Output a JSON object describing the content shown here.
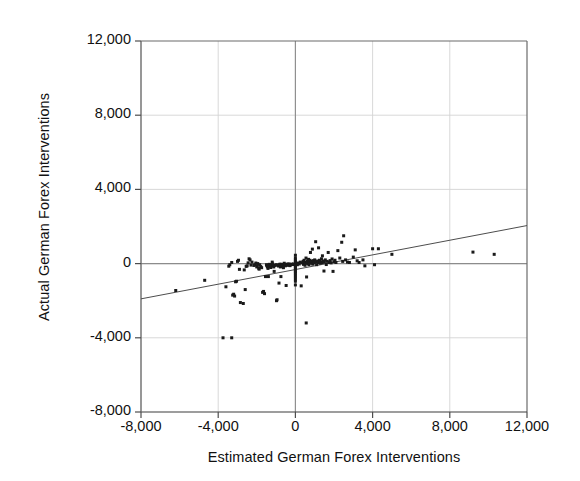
{
  "chart_data": {
    "type": "scatter",
    "title": "",
    "xlabel": "Estimated German Forex Interventions",
    "ylabel": "Actual German Forex Interventions",
    "xlim": [
      -8000,
      12000
    ],
    "ylim": [
      -8000,
      12000
    ],
    "xticks": [
      -8000,
      -4000,
      0,
      4000,
      8000,
      12000
    ],
    "yticks": [
      -8000,
      -4000,
      0,
      4000,
      8000,
      12000
    ],
    "xtick_labels": [
      "-8,000",
      "-4,000",
      "0",
      "4,000",
      "8,000",
      "12,000"
    ],
    "ytick_labels": [
      "-8,000",
      "-4,000",
      "0",
      "4,000",
      "8,000",
      "12,000"
    ],
    "grid": true,
    "legend": "none",
    "marker": "square",
    "marker_color": "#1a1a1a",
    "marker_size": 3,
    "fit_line": {
      "type": "linear",
      "slope": 0.1975,
      "intercept": -320,
      "x_start": -8000,
      "x_end": 12000,
      "y_start": -1900,
      "y_end": 2050,
      "color": "#4d4d4d"
    },
    "points": [
      [
        -6200,
        -1450
      ],
      [
        -4700,
        -900
      ],
      [
        -3750,
        -4000
      ],
      [
        -3300,
        -4000
      ],
      [
        -3600,
        -1250
      ],
      [
        -3450,
        -140
      ],
      [
        -3400,
        -60
      ],
      [
        -3300,
        60
      ],
      [
        -3250,
        -1700
      ],
      [
        -3200,
        -1650
      ],
      [
        -3150,
        -1750
      ],
      [
        -3100,
        -980
      ],
      [
        -3050,
        -950
      ],
      [
        -3000,
        120
      ],
      [
        -2950,
        180
      ],
      [
        -2900,
        -310
      ],
      [
        -2850,
        -2100
      ],
      [
        -2700,
        -2150
      ],
      [
        -2650,
        -340
      ],
      [
        -2600,
        -1400
      ],
      [
        -2550,
        -150
      ],
      [
        -2500,
        -120
      ],
      [
        -2450,
        40
      ],
      [
        -2400,
        260
      ],
      [
        -2350,
        200
      ],
      [
        -2300,
        -80
      ],
      [
        -2250,
        80
      ],
      [
        -2150,
        -100
      ],
      [
        -2100,
        -60
      ],
      [
        -2050,
        30
      ],
      [
        -2000,
        -180
      ],
      [
        -1980,
        -130
      ],
      [
        -1950,
        0
      ],
      [
        -1900,
        -250
      ],
      [
        -1880,
        -300
      ],
      [
        -1850,
        -60
      ],
      [
        -1800,
        -160
      ],
      [
        -1750,
        -220
      ],
      [
        -1700,
        -1550
      ],
      [
        -1650,
        -1500
      ],
      [
        -1600,
        -1620
      ],
      [
        -1550,
        -700
      ],
      [
        -1500,
        -60
      ],
      [
        -1480,
        -110
      ],
      [
        -1450,
        -180
      ],
      [
        -1420,
        -260
      ],
      [
        -1400,
        -700
      ],
      [
        -1380,
        -90
      ],
      [
        -1350,
        -40
      ],
      [
        -1300,
        -150
      ],
      [
        -1280,
        -210
      ],
      [
        -1250,
        -60
      ],
      [
        -1200,
        80
      ],
      [
        -1180,
        -20
      ],
      [
        -1150,
        -130
      ],
      [
        -1120,
        -180
      ],
      [
        -1100,
        -420
      ],
      [
        -1050,
        -100
      ],
      [
        -1000,
        -60
      ],
      [
        -980,
        -2000
      ],
      [
        -950,
        -1950
      ],
      [
        -900,
        -80
      ],
      [
        -880,
        -130
      ],
      [
        -850,
        -1050
      ],
      [
        -820,
        -60
      ],
      [
        -800,
        -30
      ],
      [
        -780,
        -180
      ],
      [
        -750,
        -700
      ],
      [
        -720,
        -90
      ],
      [
        -700,
        -40
      ],
      [
        -680,
        -150
      ],
      [
        -650,
        -60
      ],
      [
        -620,
        -220
      ],
      [
        -600,
        -80
      ],
      [
        -580,
        20
      ],
      [
        -550,
        -40
      ],
      [
        -520,
        -120
      ],
      [
        -500,
        -70
      ],
      [
        -480,
        -1180
      ],
      [
        -450,
        -60
      ],
      [
        -420,
        -30
      ],
      [
        -400,
        -90
      ],
      [
        -380,
        -50
      ],
      [
        -350,
        -20
      ],
      [
        -320,
        -70
      ],
      [
        -300,
        -40
      ],
      [
        -280,
        -110
      ],
      [
        -250,
        -60
      ],
      [
        -200,
        -30
      ],
      [
        -150,
        -50
      ],
      [
        -100,
        -20
      ],
      [
        0,
        450
      ],
      [
        0,
        300
      ],
      [
        0,
        200
      ],
      [
        0,
        120
      ],
      [
        0,
        60
      ],
      [
        0,
        0
      ],
      [
        0,
        -60
      ],
      [
        0,
        -130
      ],
      [
        0,
        -200
      ],
      [
        0,
        -280
      ],
      [
        0,
        -360
      ],
      [
        0,
        -440
      ],
      [
        0,
        -520
      ],
      [
        0,
        -620
      ],
      [
        0,
        -720
      ],
      [
        0,
        -830
      ],
      [
        0,
        -950
      ],
      [
        0,
        -1150
      ],
      [
        100,
        -60
      ],
      [
        150,
        30
      ],
      [
        200,
        -20
      ],
      [
        250,
        80
      ],
      [
        300,
        -1200
      ],
      [
        350,
        40
      ],
      [
        400,
        120
      ],
      [
        420,
        -40
      ],
      [
        450,
        180
      ],
      [
        480,
        60
      ],
      [
        500,
        -90
      ],
      [
        520,
        20
      ],
      [
        550,
        300
      ],
      [
        560,
        -3200
      ],
      [
        580,
        -720
      ],
      [
        600,
        60
      ],
      [
        620,
        140
      ],
      [
        650,
        0
      ],
      [
        680,
        230
      ],
      [
        700,
        -60
      ],
      [
        720,
        80
      ],
      [
        750,
        180
      ],
      [
        780,
        600
      ],
      [
        800,
        20
      ],
      [
        820,
        120
      ],
      [
        850,
        60
      ],
      [
        880,
        780
      ],
      [
        900,
        -30
      ],
      [
        920,
        160
      ],
      [
        950,
        90
      ],
      [
        980,
        40
      ],
      [
        1000,
        200
      ],
      [
        1050,
        1180
      ],
      [
        1080,
        100
      ],
      [
        1100,
        -60
      ],
      [
        1150,
        140
      ],
      [
        1180,
        60
      ],
      [
        1200,
        850
      ],
      [
        1250,
        180
      ],
      [
        1280,
        20
      ],
      [
        1300,
        100
      ],
      [
        1350,
        260
      ],
      [
        1380,
        60
      ],
      [
        1400,
        420
      ],
      [
        1450,
        140
      ],
      [
        1480,
        -400
      ],
      [
        1500,
        80
      ],
      [
        1550,
        200
      ],
      [
        1600,
        -50
      ],
      [
        1650,
        120
      ],
      [
        1700,
        600
      ],
      [
        1750,
        60
      ],
      [
        1800,
        160
      ],
      [
        1850,
        40
      ],
      [
        1900,
        250
      ],
      [
        1950,
        -420
      ],
      [
        2000,
        100
      ],
      [
        2050,
        180
      ],
      [
        2100,
        60
      ],
      [
        2200,
        700
      ],
      [
        2300,
        300
      ],
      [
        2400,
        1150
      ],
      [
        2450,
        120
      ],
      [
        2500,
        1500
      ],
      [
        2600,
        200
      ],
      [
        2700,
        80
      ],
      [
        2800,
        60
      ],
      [
        3000,
        350
      ],
      [
        3100,
        740
      ],
      [
        3200,
        150
      ],
      [
        3300,
        60
      ],
      [
        3500,
        200
      ],
      [
        3600,
        -120
      ],
      [
        4000,
        800
      ],
      [
        4100,
        -60
      ],
      [
        4300,
        800
      ],
      [
        5000,
        500
      ],
      [
        9200,
        620
      ],
      [
        10300,
        500
      ]
    ]
  }
}
